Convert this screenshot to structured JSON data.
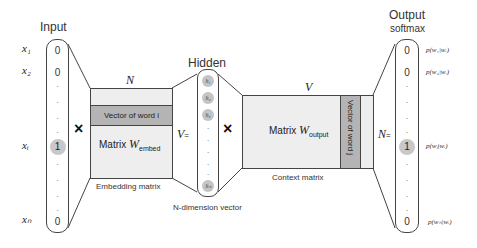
{
  "input": {
    "title": "Input",
    "labels": [
      "x₁",
      "x₂",
      "xᵢ",
      "xₙ"
    ],
    "values": [
      "0",
      "0",
      "1",
      "0"
    ]
  },
  "embedding": {
    "top_label": "N",
    "row_label": "Vector of word i",
    "matrix_label": "Matrix ",
    "matrix_symbol": "W",
    "matrix_sub": "embed",
    "caption": "Embedding matrix",
    "side_label": "V",
    "equals": "="
  },
  "hidden": {
    "title": "Hidden",
    "units": [
      "h₁",
      "h₂",
      "h₃",
      "hₙ"
    ],
    "caption": "N-dimension vector"
  },
  "context": {
    "top_label": "V",
    "col_label": "Vector of word j",
    "matrix_label": "Matrix ",
    "matrix_symbol": "W",
    "matrix_sub": "output",
    "caption": "Context matrix",
    "side_label": "N",
    "equals": "="
  },
  "output": {
    "title": "Output",
    "subtitle": "softmax",
    "values": [
      "0",
      "0",
      "1",
      "0"
    ],
    "probs": [
      "p(w₁|wᵢ)",
      "p(w₂|wᵢ)",
      "p(wⱼ|wᵢ)",
      "p(wₙ|wᵢ)"
    ]
  },
  "operators": {
    "multiply": "×"
  },
  "colors": {
    "matrix_fill": "#eeeeee",
    "vector_fill": "#b4b4b4",
    "highlight": "#c8c8c8",
    "stroke": "#444444"
  }
}
